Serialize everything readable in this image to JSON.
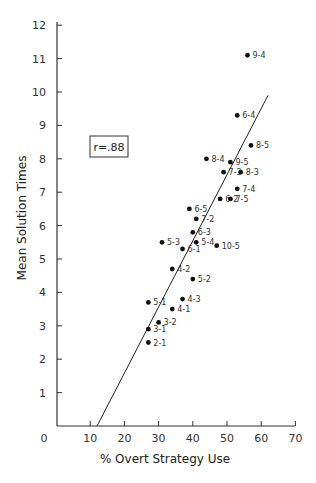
{
  "chart_data": {
    "type": "scatter",
    "title": "",
    "xlabel": "% Overt Strategy Use",
    "ylabel": "Mean Solution Times",
    "xlim": [
      0,
      70
    ],
    "ylim": [
      0,
      12
    ],
    "xticks": [
      0,
      10,
      20,
      30,
      40,
      50,
      60,
      70
    ],
    "yticks": [
      1,
      2,
      3,
      4,
      5,
      6,
      7,
      8,
      9,
      10,
      11,
      12
    ],
    "grid": false,
    "legend": null,
    "annotation": "r=.88",
    "points": [
      {
        "label": "9-4",
        "x": 56,
        "y": 11.1
      },
      {
        "label": "6-4",
        "x": 53,
        "y": 9.3
      },
      {
        "label": "8-5",
        "x": 57,
        "y": 8.4
      },
      {
        "label": "8-4",
        "x": 44,
        "y": 8.0
      },
      {
        "label": "9-5",
        "x": 51,
        "y": 7.9
      },
      {
        "label": "7-3",
        "x": 49,
        "y": 7.6
      },
      {
        "label": "8-3",
        "x": 54,
        "y": 7.6
      },
      {
        "label": "7-4",
        "x": 53,
        "y": 7.1
      },
      {
        "label": "6-2",
        "x": 48,
        "y": 6.8
      },
      {
        "label": "7-5",
        "x": 51,
        "y": 6.8
      },
      {
        "label": "6-5",
        "x": 39,
        "y": 6.5
      },
      {
        "label": "7-2",
        "x": 41,
        "y": 6.2
      },
      {
        "label": "6-3",
        "x": 40,
        "y": 5.8
      },
      {
        "label": "5-3",
        "x": 31,
        "y": 5.5
      },
      {
        "label": "5-4",
        "x": 41,
        "y": 5.5
      },
      {
        "label": "10-5",
        "x": 47,
        "y": 5.4
      },
      {
        "label": "6-1",
        "x": 37,
        "y": 5.3
      },
      {
        "label": "4-2",
        "x": 34,
        "y": 4.7
      },
      {
        "label": "5-2",
        "x": 40,
        "y": 4.4
      },
      {
        "label": "4-3",
        "x": 37,
        "y": 3.8
      },
      {
        "label": "5-1",
        "x": 27,
        "y": 3.7
      },
      {
        "label": "4-1",
        "x": 34,
        "y": 3.5
      },
      {
        "label": "3-2",
        "x": 30,
        "y": 3.1
      },
      {
        "label": "3-1",
        "x": 27,
        "y": 2.9
      },
      {
        "label": "2-1",
        "x": 27,
        "y": 2.5
      }
    ],
    "regression_line": {
      "x1": 12,
      "y1": 0,
      "x2": 62,
      "y2": 9.9
    }
  }
}
